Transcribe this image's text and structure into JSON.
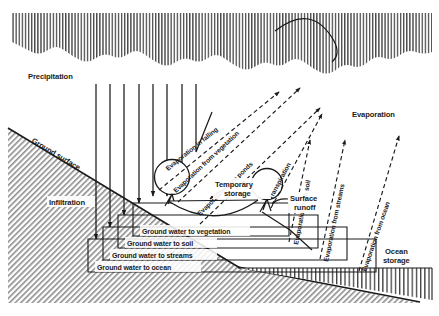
{
  "figure": {
    "type": "hydrologic-cycle-diagram",
    "title": "",
    "background_color": "#ffffff",
    "ink_color": "#1a1a1a"
  },
  "labels": {
    "precipitation": "Precipitation",
    "ground_surface": "Ground surface",
    "infiltration": "Infiltration",
    "evaporation": "Evaporation",
    "evaporation_in_falling": "Evaporation in falling",
    "evaporation_from_vegetation": "Evaporation from vegetation",
    "evaporation_from_ponds": "Evaporation from ponds",
    "transpiration": "Transpiration",
    "evaporation_from_soil": "Evaporation from soil",
    "evaporation_from_streams": "Evaporation from streams",
    "evaporation_from_ocean": "Evaporation from ocean",
    "temporary_storage": "Temporary",
    "temporary_storage2": "storage",
    "surface_runoff": "Surface",
    "surface_runoff2": "runoff",
    "ocean_storage": "Ocean",
    "ocean_storage2": "storage",
    "ground_water_to_vegetation": "Ground water to vegetation",
    "ground_water_to_soil": "Ground water to soil",
    "ground_water_to_streams": "Ground water to streams",
    "ground_water_to_ocean": "Ground water to ocean"
  },
  "elements": {
    "cloud_band": "scalloped-vertical-hatch-band",
    "sun_arc": "arc",
    "precipitation_lines": 7,
    "vegetation_circles": 2,
    "pond": "temporary-storage-pond",
    "ocean_wedge": "vertical-hatch-triangle",
    "groundwater_boxes": 4
  }
}
